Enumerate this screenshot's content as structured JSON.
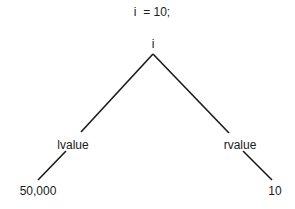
{
  "diagram": {
    "title": "i  = 10;",
    "root": {
      "label": "i"
    },
    "left": {
      "label": "lvalue",
      "value": "50,000"
    },
    "right": {
      "label": "rvalue",
      "value": "10"
    },
    "line_color": "#1a1a1a"
  }
}
